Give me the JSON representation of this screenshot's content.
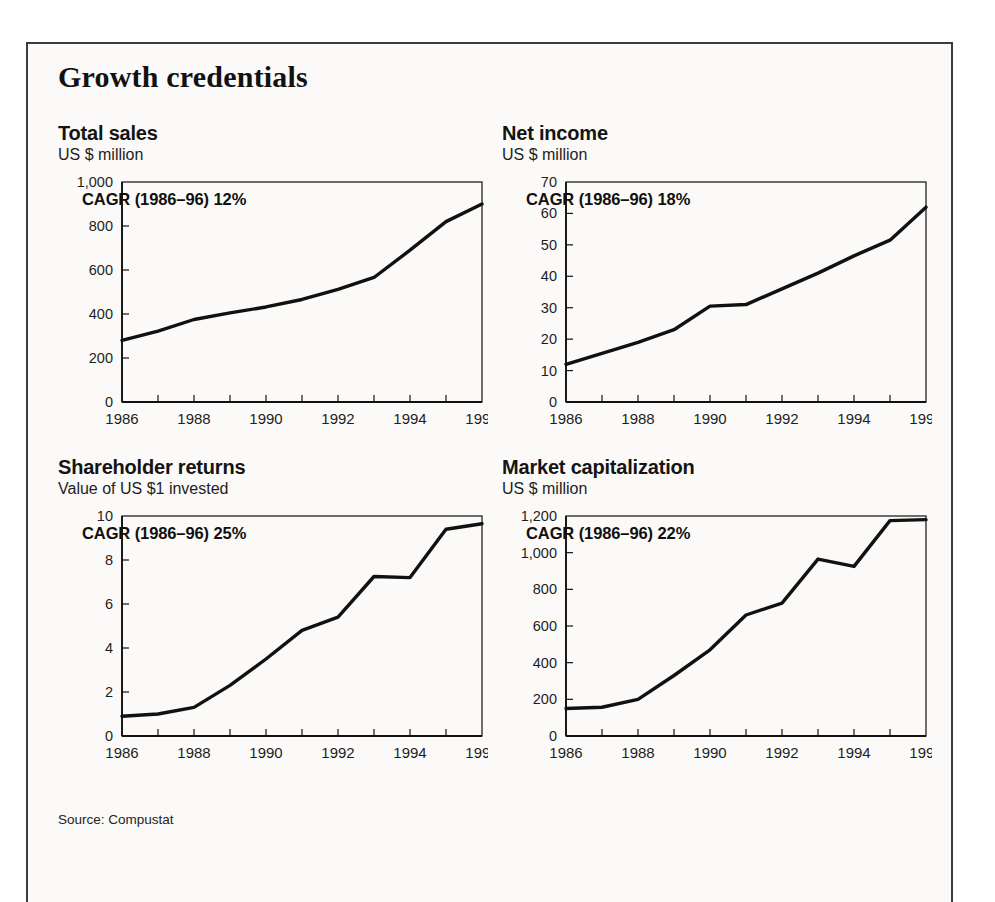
{
  "exhibit": {
    "title": "Growth credentials",
    "source_note": "Source: Compustat",
    "frame_color": "#3c3c3c",
    "line_color": "#111111",
    "background": "#fbfaf8"
  },
  "panels": [
    {
      "id": "total-sales",
      "title": "Total sales",
      "subtitle": "US $ million",
      "cagr_label": "CAGR (1986–96) 12%"
    },
    {
      "id": "net-income",
      "title": "Net income",
      "subtitle": "US $ million",
      "cagr_label": "CAGR (1986–96) 18%"
    },
    {
      "id": "shareholder-returns",
      "title": "Shareholder returns",
      "subtitle": "Value of US $1 invested",
      "cagr_label": "CAGR (1986–96) 25%"
    },
    {
      "id": "market-capitalization",
      "title": "Market capitalization",
      "subtitle": "US $ million",
      "cagr_label": "CAGR (1986–96) 22%"
    }
  ],
  "chart_data": [
    {
      "type": "line",
      "title": "Total sales",
      "subtitle": "US $ million",
      "xlabel": "",
      "ylabel": "US $ million",
      "annotation": "CAGR (1986–96) 12%",
      "x": [
        1986,
        1987,
        1988,
        1989,
        1990,
        1991,
        1992,
        1993,
        1994,
        1995,
        1996
      ],
      "values": [
        280,
        322,
        375,
        405,
        432,
        466,
        512,
        566,
        690,
        820,
        900
      ],
      "xlim": [
        1986,
        1996
      ],
      "ylim": [
        0,
        1000
      ],
      "yticks": [
        0,
        200,
        400,
        600,
        800,
        1000
      ],
      "ytick_labels": [
        "0",
        "200",
        "400",
        "600",
        "800",
        "1,000"
      ],
      "xticks": [
        1986,
        1987,
        1988,
        1989,
        1990,
        1991,
        1992,
        1993,
        1994,
        1995,
        1996
      ],
      "xtick_labels": [
        "1986",
        "",
        "1988",
        "",
        "1990",
        "",
        "1992",
        "",
        "1994",
        "",
        "1996"
      ],
      "grid": false,
      "legend": "none"
    },
    {
      "type": "line",
      "title": "Net income",
      "subtitle": "US $ million",
      "xlabel": "",
      "ylabel": "US $ million",
      "annotation": "CAGR (1986–96) 18%",
      "x": [
        1986,
        1987,
        1988,
        1989,
        1990,
        1991,
        1992,
        1993,
        1994,
        1995,
        1996
      ],
      "values": [
        12,
        15.5,
        19,
        23,
        30.5,
        31,
        36,
        41,
        46.5,
        51.5,
        62
      ],
      "xlim": [
        1986,
        1996
      ],
      "ylim": [
        0,
        70
      ],
      "yticks": [
        0,
        10,
        20,
        30,
        40,
        50,
        60,
        70
      ],
      "ytick_labels": [
        "0",
        "10",
        "20",
        "30",
        "40",
        "50",
        "60",
        "70"
      ],
      "xticks": [
        1986,
        1987,
        1988,
        1989,
        1990,
        1991,
        1992,
        1993,
        1994,
        1995,
        1996
      ],
      "xtick_labels": [
        "1986",
        "",
        "1988",
        "",
        "1990",
        "",
        "1992",
        "",
        "1994",
        "",
        "1996"
      ],
      "grid": false,
      "legend": "none"
    },
    {
      "type": "line",
      "title": "Shareholder returns",
      "subtitle": "Value of US $1 invested",
      "xlabel": "",
      "ylabel": "Value of US $1 invested",
      "annotation": "CAGR (1986–96) 25%",
      "x": [
        1986,
        1987,
        1988,
        1989,
        1990,
        1991,
        1992,
        1993,
        1994,
        1995,
        1996
      ],
      "values": [
        0.9,
        1.0,
        1.3,
        2.3,
        3.5,
        4.8,
        5.4,
        7.25,
        7.2,
        9.4,
        9.65
      ],
      "xlim": [
        1986,
        1996
      ],
      "ylim": [
        0,
        10
      ],
      "yticks": [
        0,
        2,
        4,
        6,
        8,
        10
      ],
      "ytick_labels": [
        "0",
        "2",
        "4",
        "6",
        "8",
        "10"
      ],
      "xticks": [
        1986,
        1987,
        1988,
        1989,
        1990,
        1991,
        1992,
        1993,
        1994,
        1995,
        1996
      ],
      "xtick_labels": [
        "1986",
        "",
        "1988",
        "",
        "1990",
        "",
        "1992",
        "",
        "1994",
        "",
        "1996"
      ],
      "grid": false,
      "legend": "none"
    },
    {
      "type": "line",
      "title": "Market capitalization",
      "subtitle": "US $ million",
      "xlabel": "",
      "ylabel": "US $ million",
      "annotation": "CAGR (1986–96) 22%",
      "x": [
        1986,
        1987,
        1988,
        1989,
        1990,
        1991,
        1992,
        1993,
        1994,
        1995,
        1996
      ],
      "values": [
        150,
        157,
        200,
        330,
        470,
        660,
        725,
        965,
        925,
        1175,
        1180
      ],
      "xlim": [
        1986,
        1996
      ],
      "ylim": [
        0,
        1200
      ],
      "yticks": [
        0,
        200,
        400,
        600,
        800,
        1000,
        1200
      ],
      "ytick_labels": [
        "0",
        "200",
        "400",
        "600",
        "800",
        "1,000",
        "1,200"
      ],
      "xticks": [
        1986,
        1987,
        1988,
        1989,
        1990,
        1991,
        1992,
        1993,
        1994,
        1995,
        1996
      ],
      "xtick_labels": [
        "1986",
        "",
        "1988",
        "",
        "1990",
        "",
        "1992",
        "",
        "1994",
        "",
        "1996"
      ],
      "grid": false,
      "legend": "none"
    }
  ]
}
